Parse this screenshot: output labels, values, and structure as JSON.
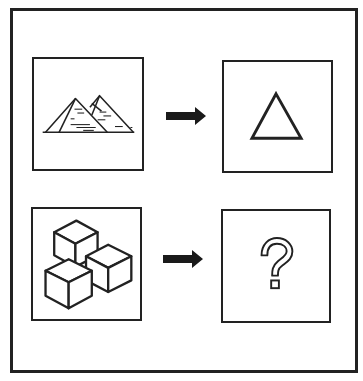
{
  "puzzle": {
    "type": "visual-analogy",
    "rows": [
      {
        "left": {
          "icon": "pyramids-icon",
          "label": "Pyramids"
        },
        "arrow": "right-arrow-icon",
        "right": {
          "icon": "triangle-icon",
          "label": "Triangle"
        }
      },
      {
        "left": {
          "icon": "cubes-icon",
          "label": "Cubes"
        },
        "arrow": "right-arrow-icon",
        "right": {
          "icon": "question-mark-icon",
          "label": "?"
        }
      }
    ],
    "colors": {
      "stroke": "#222222",
      "background": "#ffffff"
    }
  }
}
